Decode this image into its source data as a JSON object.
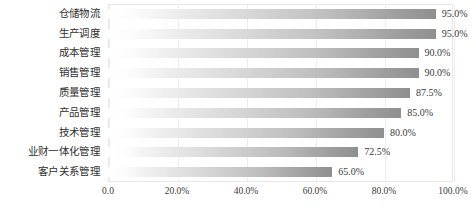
{
  "chart_data": {
    "type": "bar",
    "orientation": "horizontal",
    "title": "",
    "xlabel": "",
    "ylabel": "",
    "xlim": [
      0,
      100
    ],
    "grid": "vertical",
    "legend": "none",
    "value_suffix": "%",
    "categories": [
      "仓储物流",
      "生产调度",
      "成本管理",
      "销售管理",
      "质量管理",
      "产品管理",
      "技术管理",
      "业财一体化管理",
      "客户关系管理"
    ],
    "values": [
      95.0,
      95.0,
      90.0,
      90.0,
      87.5,
      85.0,
      80.0,
      72.5,
      65.0
    ],
    "value_labels": [
      "95.0%",
      "95.0%",
      "90.0%",
      "90.0%",
      "87.5%",
      "85.0%",
      "80.0%",
      "72.5%",
      "65.0%"
    ],
    "xticks": [
      0,
      20,
      40,
      60,
      80,
      100
    ],
    "xtick_labels": [
      "0.0",
      "20.0%",
      "40.0%",
      "60.0%",
      "80.0%",
      "100.0%"
    ],
    "colors": {
      "bar_gradient_start": "#ffffff",
      "bar_gradient_end": "#8f8f8f",
      "gridline": "#ededed",
      "plot_border": "#e8e8e8",
      "text": "#3a3a3a",
      "background": "#ffffff"
    }
  }
}
